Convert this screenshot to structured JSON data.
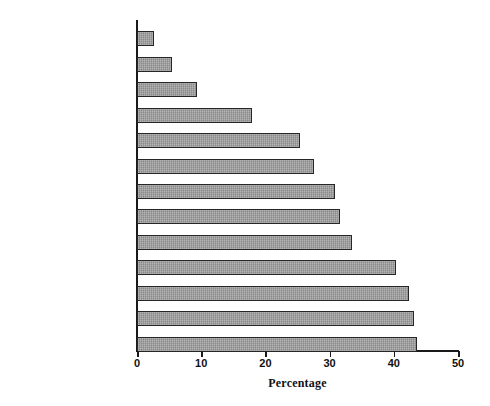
{
  "chart_data": {
    "type": "bar",
    "orientation": "horizontal",
    "title": "",
    "xlabel": "Percentage",
    "ylabel": "",
    "xlim": [
      0,
      50
    ],
    "xticks": [
      0,
      10,
      20,
      30,
      40,
      50
    ],
    "grid": false,
    "legend": null,
    "highlight_category": "NEW ZEALAND",
    "categories": [
      "JAPAN",
      "GREECE",
      "IRELAND",
      "SPAIN",
      "GERMANY",
      "NETHERLANDS",
      "AUSTRALIA",
      "IRELAND",
      "UNITED STATES",
      "ENGLAND & WALES",
      "FRANCE",
      "NEW ZEALAND",
      "DENMARK"
    ],
    "values": [
      2.6,
      5.4,
      9.3,
      17.9,
      25.4,
      27.6,
      30.8,
      31.6,
      33.5,
      40.3,
      42.4,
      43.1,
      43.6
    ],
    "bars": [
      {
        "label": "JAPAN",
        "value": 2.6,
        "highlight": false
      },
      {
        "label": "GREECE",
        "value": 5.4,
        "highlight": false
      },
      {
        "label": "IRELAND",
        "value": 9.3,
        "highlight": false
      },
      {
        "label": "SPAIN",
        "value": 17.9,
        "highlight": false
      },
      {
        "label": "GERMANY",
        "value": 25.4,
        "highlight": false
      },
      {
        "label": "NETHERLANDS",
        "value": 27.6,
        "highlight": false
      },
      {
        "label": "AUSTRALIA",
        "value": 30.8,
        "highlight": false
      },
      {
        "label": "IRELAND",
        "value": 31.6,
        "highlight": false
      },
      {
        "label": "UNITED STATES",
        "value": 33.5,
        "highlight": false
      },
      {
        "label": "ENGLAND & WALES",
        "value": 40.3,
        "highlight": false
      },
      {
        "label": "FRANCE",
        "value": 42.4,
        "highlight": false
      },
      {
        "label": "NEW ZEALAND",
        "value": 43.1,
        "highlight": true
      },
      {
        "label": "DENMARK",
        "value": 43.6,
        "highlight": false
      }
    ],
    "colors": {
      "bar_fill": "#9a9a9a",
      "bar_stroke": "#262626",
      "axis": "#1a1a1a",
      "text": "#111111",
      "background": "#ffffff"
    }
  },
  "axis": {
    "tick_labels": [
      "0",
      "10",
      "20",
      "30",
      "40",
      "50"
    ],
    "title": "Percentage"
  }
}
